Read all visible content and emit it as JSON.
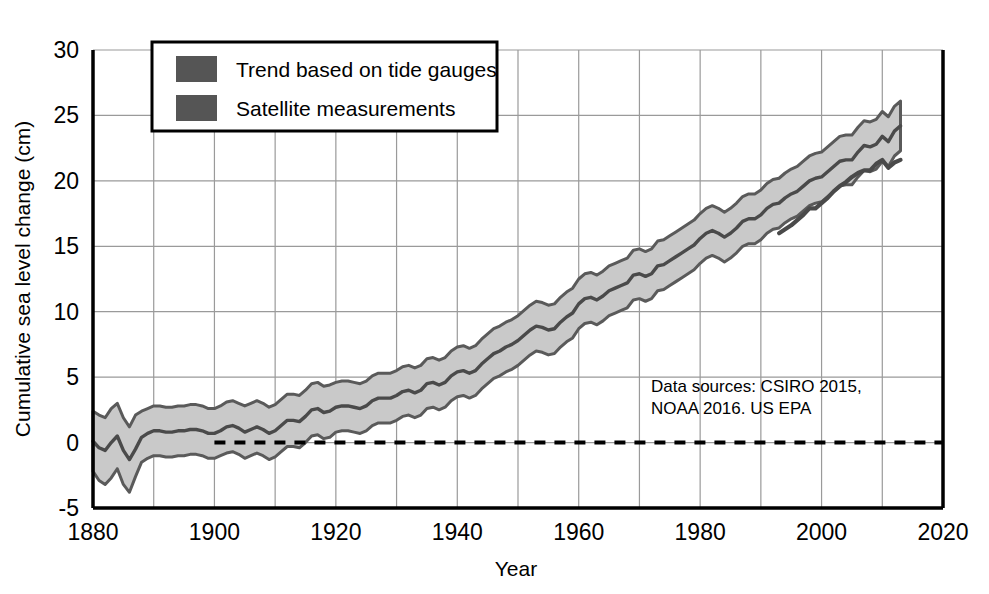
{
  "chart_data": {
    "type": "area",
    "title": "",
    "subtitle": "",
    "xlabel": "Year",
    "ylabel": "Cumulative sea level change (cm)",
    "xlim": [
      1880,
      2020
    ],
    "ylim": [
      -5,
      30
    ],
    "x_ticks": [
      "1880",
      "1900",
      "1920",
      "1940",
      "1960",
      "1980",
      "2000",
      "2020"
    ],
    "x_tick_values": [
      1880,
      1900,
      1920,
      1940,
      1960,
      1980,
      2000,
      2020
    ],
    "x_minor_step": 10,
    "y_ticks": [
      "-5",
      "0",
      "5",
      "10",
      "15",
      "20",
      "25",
      "30"
    ],
    "y_tick_values": [
      -5,
      0,
      5,
      10,
      15,
      20,
      25,
      30
    ],
    "grid": true,
    "legend_position": "top-left-inside",
    "legend": [
      {
        "label": "Trend based on tide gauges",
        "swatch_color": "#555555"
      },
      {
        "label": "Satellite measurements",
        "swatch_color": "#555555"
      }
    ],
    "annotations": [
      {
        "name": "data-sources",
        "line1": "Data sources: CSIRO 2015,",
        "line2": "NOAA 2016. US EPA",
        "x": 1969,
        "y": 3.6
      }
    ],
    "reference_line": {
      "name": "zero-baseline",
      "value": 0,
      "style": "dashed",
      "x_start": 1900,
      "x_end": 2020,
      "color": "#000000"
    },
    "colors": {
      "band_fill": "#c9c9c9",
      "band_edge": "#5a5a5a",
      "trend_line": "#4a4a4a",
      "satellite_line": "#4a4a4a",
      "grid": "#9a9a9a",
      "axis": "#000000",
      "background": "#ffffff"
    },
    "series": [
      {
        "name": "Trend based on tide gauges",
        "type": "line-with-band",
        "x": [
          1880,
          1881,
          1882,
          1883,
          1884,
          1885,
          1886,
          1887,
          1888,
          1889,
          1890,
          1891,
          1892,
          1893,
          1894,
          1895,
          1896,
          1897,
          1898,
          1899,
          1900,
          1901,
          1902,
          1903,
          1904,
          1905,
          1906,
          1907,
          1908,
          1909,
          1910,
          1911,
          1912,
          1913,
          1914,
          1915,
          1916,
          1917,
          1918,
          1919,
          1920,
          1921,
          1922,
          1923,
          1924,
          1925,
          1926,
          1927,
          1928,
          1929,
          1930,
          1931,
          1932,
          1933,
          1934,
          1935,
          1936,
          1937,
          1938,
          1939,
          1940,
          1941,
          1942,
          1943,
          1944,
          1945,
          1946,
          1947,
          1948,
          1949,
          1950,
          1951,
          1952,
          1953,
          1954,
          1955,
          1956,
          1957,
          1958,
          1959,
          1960,
          1961,
          1962,
          1963,
          1964,
          1965,
          1966,
          1967,
          1968,
          1969,
          1970,
          1971,
          1972,
          1973,
          1974,
          1975,
          1976,
          1977,
          1978,
          1979,
          1980,
          1981,
          1982,
          1983,
          1984,
          1985,
          1986,
          1987,
          1988,
          1989,
          1990,
          1991,
          1992,
          1993,
          1994,
          1995,
          1996,
          1997,
          1998,
          1999,
          2000,
          2001,
          2002,
          2003,
          2004,
          2005,
          2006,
          2007,
          2008,
          2009,
          2010,
          2011,
          2012,
          2013
        ],
        "values": [
          0.1,
          -0.4,
          -0.6,
          0.0,
          0.5,
          -0.6,
          -1.3,
          -0.5,
          0.4,
          0.7,
          0.9,
          0.9,
          0.8,
          0.8,
          0.9,
          0.9,
          1.0,
          1.0,
          0.9,
          0.7,
          0.7,
          0.9,
          1.2,
          1.3,
          1.1,
          0.8,
          1.0,
          1.2,
          1.0,
          0.7,
          0.9,
          1.3,
          1.7,
          1.7,
          1.6,
          2.0,
          2.5,
          2.6,
          2.3,
          2.4,
          2.7,
          2.8,
          2.8,
          2.7,
          2.6,
          2.8,
          3.2,
          3.4,
          3.4,
          3.4,
          3.6,
          3.9,
          4.0,
          3.8,
          4.0,
          4.5,
          4.6,
          4.4,
          4.6,
          5.1,
          5.4,
          5.5,
          5.3,
          5.5,
          6.0,
          6.4,
          6.8,
          7.0,
          7.3,
          7.5,
          7.8,
          8.2,
          8.6,
          8.9,
          8.8,
          8.6,
          8.7,
          9.2,
          9.6,
          9.9,
          10.6,
          11.0,
          11.1,
          10.9,
          11.2,
          11.6,
          11.8,
          12.0,
          12.2,
          12.8,
          12.9,
          12.7,
          12.9,
          13.5,
          13.6,
          13.9,
          14.2,
          14.5,
          14.8,
          15.1,
          15.6,
          16.0,
          16.2,
          16.0,
          15.7,
          16.0,
          16.4,
          16.9,
          17.1,
          17.1,
          17.4,
          17.9,
          18.2,
          18.3,
          18.7,
          19.0,
          19.2,
          19.6,
          20.0,
          20.2,
          20.3,
          20.7,
          21.1,
          21.5,
          21.6,
          21.6,
          22.2,
          22.7,
          22.6,
          22.8,
          23.4,
          23.0,
          23.8,
          24.2
        ],
        "lower": [
          -2.2,
          -2.9,
          -3.2,
          -2.7,
          -2.0,
          -3.2,
          -3.8,
          -2.6,
          -1.5,
          -1.2,
          -1.0,
          -1.0,
          -1.1,
          -1.1,
          -1.0,
          -1.0,
          -0.9,
          -0.9,
          -1.0,
          -1.2,
          -1.2,
          -1.0,
          -0.8,
          -0.7,
          -0.9,
          -1.2,
          -1.0,
          -0.8,
          -1.0,
          -1.3,
          -1.1,
          -0.7,
          -0.3,
          -0.3,
          -0.4,
          0.0,
          0.5,
          0.6,
          0.3,
          0.4,
          0.8,
          0.9,
          0.9,
          0.8,
          0.7,
          0.9,
          1.3,
          1.5,
          1.5,
          1.5,
          1.7,
          2.0,
          2.1,
          1.9,
          2.1,
          2.6,
          2.7,
          2.5,
          2.7,
          3.2,
          3.5,
          3.6,
          3.4,
          3.6,
          4.1,
          4.5,
          4.9,
          5.1,
          5.4,
          5.6,
          5.9,
          6.3,
          6.7,
          7.0,
          6.9,
          6.7,
          6.8,
          7.3,
          7.7,
          8.0,
          8.7,
          9.1,
          9.2,
          9.0,
          9.3,
          9.7,
          9.9,
          10.1,
          10.3,
          10.9,
          11.0,
          10.8,
          11.0,
          11.6,
          11.7,
          12.0,
          12.3,
          12.6,
          12.9,
          13.2,
          13.7,
          14.1,
          14.3,
          14.1,
          13.8,
          14.1,
          14.5,
          15.0,
          15.2,
          15.2,
          15.5,
          16.0,
          16.3,
          16.4,
          16.8,
          17.1,
          17.3,
          17.7,
          18.1,
          18.3,
          18.4,
          18.8,
          19.2,
          19.6,
          19.7,
          19.7,
          20.3,
          20.8,
          20.7,
          20.9,
          21.5,
          21.1,
          21.9,
          22.3
        ],
        "upper": [
          2.4,
          2.1,
          1.9,
          2.6,
          3.0,
          1.9,
          1.2,
          2.1,
          2.4,
          2.6,
          2.8,
          2.8,
          2.7,
          2.7,
          2.8,
          2.8,
          2.9,
          2.9,
          2.8,
          2.6,
          2.6,
          2.8,
          3.1,
          3.2,
          3.0,
          2.8,
          3.0,
          3.2,
          3.0,
          2.7,
          2.9,
          3.3,
          3.7,
          3.7,
          3.6,
          4.0,
          4.5,
          4.6,
          4.3,
          4.4,
          4.6,
          4.7,
          4.7,
          4.6,
          4.5,
          4.7,
          5.1,
          5.3,
          5.3,
          5.3,
          5.5,
          5.8,
          5.9,
          5.7,
          5.9,
          6.4,
          6.5,
          6.3,
          6.5,
          7.0,
          7.3,
          7.4,
          7.2,
          7.4,
          7.9,
          8.3,
          8.7,
          8.9,
          9.2,
          9.4,
          9.7,
          10.1,
          10.5,
          10.8,
          10.7,
          10.5,
          10.6,
          11.1,
          11.5,
          11.8,
          12.5,
          12.9,
          13.0,
          12.8,
          13.1,
          13.5,
          13.7,
          13.9,
          14.1,
          14.7,
          14.8,
          14.6,
          14.8,
          15.4,
          15.5,
          15.8,
          16.1,
          16.4,
          16.7,
          17.0,
          17.5,
          17.9,
          18.1,
          17.9,
          17.6,
          17.9,
          18.3,
          18.8,
          19.0,
          19.0,
          19.3,
          19.8,
          20.1,
          20.2,
          20.6,
          20.9,
          21.1,
          21.5,
          21.9,
          22.1,
          22.2,
          22.6,
          23.0,
          23.4,
          23.5,
          23.5,
          24.1,
          24.6,
          24.5,
          24.7,
          25.3,
          24.9,
          25.7,
          26.1
        ]
      },
      {
        "name": "Satellite measurements",
        "type": "line",
        "x": [
          1993,
          1994,
          1995,
          1996,
          1997,
          1998,
          1999,
          2000,
          2001,
          2002,
          2003,
          2004,
          2005,
          2006,
          2007,
          2008,
          2009,
          2010,
          2011,
          2012,
          2013
        ],
        "values": [
          16.0,
          16.3,
          16.6,
          17.0,
          17.4,
          17.9,
          17.9,
          18.3,
          18.7,
          19.2,
          19.6,
          19.9,
          20.3,
          20.6,
          20.8,
          20.8,
          21.3,
          21.6,
          21.0,
          21.4,
          21.6
        ]
      }
    ]
  }
}
